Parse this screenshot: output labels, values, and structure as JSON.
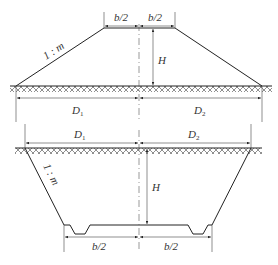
{
  "figure_top": {
    "title": "Embankment (fill) cross-section",
    "labels": {
      "half_width_left": "b/2",
      "half_width_right": "b/2",
      "height": "H",
      "slope": "1 : m",
      "dist_left": "D",
      "dist_left_sub": "1",
      "dist_right": "D",
      "dist_right_sub": "2"
    }
  },
  "figure_bottom": {
    "title": "Cutting (excavation) cross-section",
    "labels": {
      "half_width_left": "b/2",
      "half_width_right": "b/2",
      "height": "H",
      "slope": "1 : m",
      "dist_left": "D",
      "dist_left_sub": "1",
      "dist_right": "D",
      "dist_right_sub": "2"
    }
  },
  "colors": {
    "line": "#222222",
    "background": "#ffffff"
  }
}
